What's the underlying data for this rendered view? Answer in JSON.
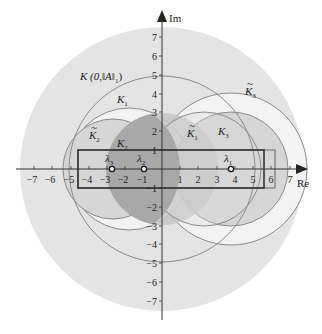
{
  "diagram": {
    "axes": {
      "x_label": "Re",
      "y_label": "Im",
      "x_ticks": [
        "−7",
        "−6",
        "−5",
        "−4",
        "−3",
        "−2",
        "−1",
        "1",
        "2",
        "3",
        "4",
        "5",
        "6",
        "7"
      ],
      "y_ticks": [
        "7",
        "6",
        "5",
        "4",
        "3",
        "2",
        "1",
        "−1",
        "−2",
        "−3",
        "−4",
        "−5",
        "−6",
        "−7"
      ]
    },
    "labels": {
      "big_disk": "K (0,‖A‖",
      "big_disk_sub": "1",
      "big_disk_close": ")",
      "K1": "K",
      "K1_sub": "1",
      "K2": "K",
      "K2_sub": "2",
      "K3": "K",
      "K3_sub": "3",
      "K1_tilde": "K",
      "K1_tilde_sub": "1",
      "K2_tilde": "K",
      "K2_tilde_sub": "2",
      "K3_tilde": "K",
      "K3_tilde_sub": "3",
      "tilde": "~"
    },
    "eigenvalues": [
      {
        "name": "λ",
        "sub": "1",
        "re": 3.8,
        "im": 0
      },
      {
        "name": "λ",
        "sub": "2",
        "re": -0.9,
        "im": 0
      },
      {
        "name": "λ",
        "sub": "3",
        "re": -2.8,
        "im": 0
      }
    ],
    "colors": {
      "big_disk": "#e4e4e4",
      "white_disk": "#f3f3f3",
      "mid_disk": "#d2d2d2",
      "center_disk": "#c2c2c2",
      "dark_lens": "#a9a9a9",
      "stroke": "#8a8a8a",
      "axis": "#333333",
      "rect": "#444444"
    }
  }
}
